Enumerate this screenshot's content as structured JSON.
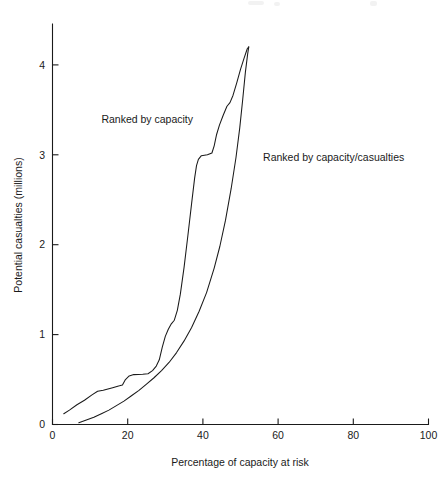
{
  "chart_data": {
    "type": "line",
    "title": "",
    "xlabel": "Percentage of capacity at risk",
    "ylabel": "Potential casualties (millions)",
    "xlim": [
      0,
      100
    ],
    "ylim": [
      0,
      4.4
    ],
    "grid": false,
    "legend_position": "inline-annotations",
    "x_ticks": [
      0,
      20,
      40,
      60,
      80,
      100
    ],
    "x_tick_labels": [
      "0",
      "20",
      "40",
      "60",
      "80",
      "100"
    ],
    "y_ticks": [
      0,
      1,
      2,
      3,
      4
    ],
    "y_tick_labels": [
      "0",
      "1",
      "2",
      "3",
      "4"
    ],
    "annotations": [
      {
        "text": "Ranked by capacity",
        "x_pct": 13,
        "y_value": 3.35
      },
      {
        "text": "Ranked by capacity/casualties",
        "x_pct": 56,
        "y_value": 2.93
      }
    ],
    "series": [
      {
        "name": "Ranked by capacity",
        "color": "#1a1a1a",
        "points": [
          [
            3.0,
            0.12
          ],
          [
            4.5,
            0.16
          ],
          [
            6.5,
            0.22
          ],
          [
            8.5,
            0.27
          ],
          [
            10.5,
            0.33
          ],
          [
            12.0,
            0.37
          ],
          [
            13.5,
            0.38
          ],
          [
            16.0,
            0.41
          ],
          [
            17.8,
            0.43
          ],
          [
            18.6,
            0.44
          ],
          [
            19.4,
            0.5
          ],
          [
            20.4,
            0.54
          ],
          [
            21.6,
            0.555
          ],
          [
            24.0,
            0.56
          ],
          [
            25.4,
            0.565
          ],
          [
            26.6,
            0.6
          ],
          [
            27.6,
            0.65
          ],
          [
            28.4,
            0.72
          ],
          [
            29.2,
            0.86
          ],
          [
            30.0,
            0.98
          ],
          [
            30.8,
            1.06
          ],
          [
            31.6,
            1.12
          ],
          [
            32.4,
            1.16
          ],
          [
            33.2,
            1.27
          ],
          [
            34.0,
            1.45
          ],
          [
            35.0,
            1.75
          ],
          [
            36.0,
            2.1
          ],
          [
            37.0,
            2.46
          ],
          [
            37.8,
            2.74
          ],
          [
            38.3,
            2.88
          ],
          [
            38.8,
            2.95
          ],
          [
            39.6,
            2.99
          ],
          [
            41.2,
            3.0
          ],
          [
            42.4,
            3.02
          ],
          [
            43.0,
            3.1
          ],
          [
            43.6,
            3.22
          ],
          [
            44.4,
            3.33
          ],
          [
            45.4,
            3.44
          ],
          [
            46.4,
            3.54
          ],
          [
            47.2,
            3.58
          ],
          [
            48.0,
            3.66
          ],
          [
            49.0,
            3.8
          ],
          [
            50.0,
            3.95
          ],
          [
            51.0,
            4.08
          ],
          [
            51.8,
            4.18
          ],
          [
            52.2,
            4.2
          ]
        ]
      },
      {
        "name": "Ranked by capacity/casualties",
        "color": "#1a1a1a",
        "points": [
          [
            7.0,
            0.02
          ],
          [
            9.0,
            0.05
          ],
          [
            11.0,
            0.08
          ],
          [
            13.0,
            0.12
          ],
          [
            15.0,
            0.16
          ],
          [
            17.0,
            0.21
          ],
          [
            19.0,
            0.26
          ],
          [
            21.0,
            0.32
          ],
          [
            23.0,
            0.38
          ],
          [
            25.0,
            0.45
          ],
          [
            27.0,
            0.52
          ],
          [
            29.0,
            0.6
          ],
          [
            31.0,
            0.69
          ],
          [
            33.0,
            0.8
          ],
          [
            35.0,
            0.93
          ],
          [
            37.0,
            1.08
          ],
          [
            39.0,
            1.26
          ],
          [
            41.0,
            1.47
          ],
          [
            43.0,
            1.74
          ],
          [
            44.5,
            1.98
          ],
          [
            46.0,
            2.27
          ],
          [
            47.5,
            2.62
          ],
          [
            48.8,
            2.97
          ],
          [
            49.8,
            3.3
          ],
          [
            50.6,
            3.62
          ],
          [
            51.3,
            3.92
          ],
          [
            51.9,
            4.12
          ],
          [
            52.2,
            4.2
          ]
        ]
      }
    ]
  }
}
